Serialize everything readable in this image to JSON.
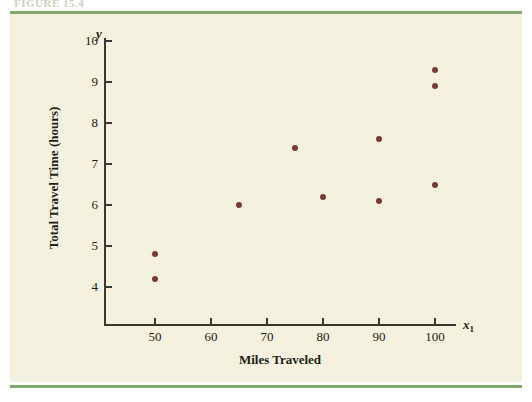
{
  "figure": {
    "header_text": "FIGURE 15.4",
    "background_color": "#f4f2de",
    "rule_color": "#7fa86a",
    "point_color": "#7a3838",
    "axis_color": "#3a3a32"
  },
  "chart_data": {
    "type": "scatter",
    "title": "",
    "xlabel": "Miles Traveled",
    "ylabel": "Total Travel Time (hours)",
    "x_variable": "x",
    "x_variable_subscript": "1",
    "y_variable": "y",
    "xlim": [
      45,
      108
    ],
    "ylim": [
      3.55,
      10.55
    ],
    "xticks": [
      50,
      60,
      70,
      80,
      90,
      100
    ],
    "yticks": [
      4,
      5,
      6,
      7,
      8,
      9,
      10
    ],
    "grid": false,
    "legend": null,
    "x": [
      50,
      50,
      65,
      75,
      80,
      90,
      90,
      100,
      100,
      100
    ],
    "y": [
      4.8,
      4.2,
      6.0,
      7.4,
      6.2,
      7.6,
      6.1,
      9.3,
      8.9,
      6.5
    ],
    "points": [
      {
        "x": 50,
        "y": 4.8
      },
      {
        "x": 50,
        "y": 4.2
      },
      {
        "x": 65,
        "y": 6.0
      },
      {
        "x": 75,
        "y": 7.4
      },
      {
        "x": 80,
        "y": 6.2
      },
      {
        "x": 90,
        "y": 7.6
      },
      {
        "x": 90,
        "y": 6.1
      },
      {
        "x": 100,
        "y": 9.3
      },
      {
        "x": 100,
        "y": 8.9
      },
      {
        "x": 100,
        "y": 6.5
      }
    ]
  }
}
